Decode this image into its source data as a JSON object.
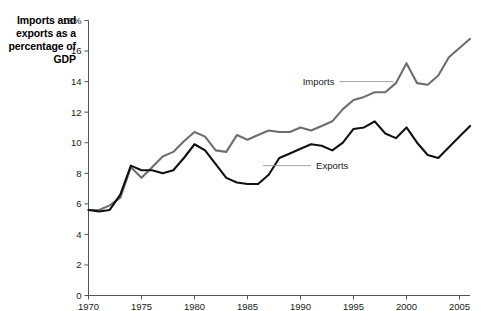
{
  "chart_data": {
    "type": "line",
    "title": "Imports and exports as a percentage of GDP",
    "xlabel": "",
    "ylabel": "",
    "ylim": [
      0,
      18
    ],
    "xlim": [
      1970,
      2006
    ],
    "grid": false,
    "legend_position": "inline-annotations",
    "y_ticks": [
      "0",
      "2",
      "4",
      "6",
      "8",
      "10",
      "12",
      "14",
      "16",
      "18%"
    ],
    "y_tick_values": [
      0,
      2,
      4,
      6,
      8,
      10,
      12,
      14,
      16,
      18
    ],
    "x_ticks": [
      "1970",
      "1975",
      "1980",
      "1985",
      "1990",
      "1995",
      "2000",
      "2005"
    ],
    "x_tick_values": [
      1970,
      1975,
      1980,
      1985,
      1990,
      1995,
      2000,
      2005
    ],
    "x": [
      1970,
      1971,
      1972,
      1973,
      1974,
      1975,
      1976,
      1977,
      1978,
      1979,
      1980,
      1981,
      1982,
      1983,
      1984,
      1985,
      1986,
      1987,
      1988,
      1989,
      1990,
      1991,
      1992,
      1993,
      1994,
      1995,
      1996,
      1997,
      1998,
      1999,
      2000,
      2001,
      2002,
      2003,
      2004,
      2005,
      2006
    ],
    "series": [
      {
        "name": "Imports",
        "color": "#6e6e6e",
        "label_x": 1993.2,
        "label_y": 14.0,
        "values": [
          5.6,
          5.6,
          5.9,
          6.4,
          8.4,
          7.7,
          8.4,
          9.1,
          9.4,
          10.1,
          10.7,
          10.4,
          9.5,
          9.4,
          10.5,
          10.2,
          10.5,
          10.8,
          10.7,
          10.7,
          11.0,
          10.8,
          11.1,
          11.4,
          12.2,
          12.8,
          13.0,
          13.3,
          13.3,
          13.9,
          15.2,
          13.9,
          13.8,
          14.4,
          15.6,
          16.2,
          16.8
        ]
      },
      {
        "name": "Exports",
        "color": "#111111",
        "label_x": 1991.0,
        "label_y": 8.5,
        "values": [
          5.6,
          5.5,
          5.6,
          6.6,
          8.5,
          8.2,
          8.2,
          8.0,
          8.2,
          9.0,
          9.9,
          9.5,
          8.6,
          7.7,
          7.4,
          7.3,
          7.3,
          7.9,
          9.0,
          9.3,
          9.6,
          9.9,
          9.8,
          9.5,
          10.0,
          10.9,
          11.0,
          11.4,
          10.6,
          10.3,
          11.0,
          10.0,
          9.2,
          9.0,
          9.7,
          10.4,
          11.1
        ]
      }
    ],
    "annotations": [
      {
        "text": "Imports",
        "leader": true
      },
      {
        "text": "Exports",
        "leader": true
      }
    ]
  },
  "figure": {
    "axis_title": "Imports and exports as a percentage of GDP"
  }
}
